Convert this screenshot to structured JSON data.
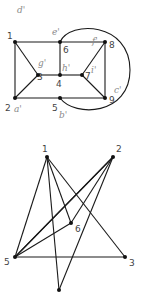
{
  "colors": {
    "edge": "#1a1a1a",
    "node": "#111111",
    "label": "#444444",
    "handwriting": "#8a8a8a"
  },
  "top_graph": {
    "nodes": [
      {
        "id": "1",
        "x": 15,
        "y": 42,
        "lx": 7,
        "ly": 39,
        "hand": "d'",
        "hx": 17,
        "hy": 13
      },
      {
        "id": "6",
        "x": 60,
        "y": 42,
        "lx": 63,
        "ly": 53,
        "hand": "e'",
        "hx": 52,
        "hy": 35
      },
      {
        "id": "8",
        "x": 105,
        "y": 42,
        "lx": 109,
        "ly": 48,
        "hand": "f'",
        "hx": 92,
        "hy": 44
      },
      {
        "id": "3",
        "x": 38,
        "y": 75,
        "lx": 37,
        "ly": 80,
        "hand": "g'",
        "hx": 38,
        "hy": 66
      },
      {
        "id": "4",
        "x": 60,
        "y": 75,
        "lx": 56,
        "ly": 87,
        "hand": "h'",
        "hx": 62,
        "hy": 71
      },
      {
        "id": "7",
        "x": 82,
        "y": 75,
        "lx": 85,
        "ly": 79,
        "hand": "i'",
        "hx": 91,
        "hy": 73
      },
      {
        "id": "2",
        "x": 15,
        "y": 98,
        "lx": 5,
        "ly": 111,
        "hand": "a'",
        "hx": 14,
        "hy": 112
      },
      {
        "id": "5",
        "x": 60,
        "y": 98,
        "lx": 52,
        "ly": 111,
        "hand": "b'",
        "hx": 59,
        "hy": 118
      },
      {
        "id": "9",
        "x": 105,
        "y": 98,
        "lx": 109,
        "ly": 103,
        "hand": "c'",
        "hx": 114,
        "hy": 93
      }
    ],
    "edges": [
      [
        "1",
        "6"
      ],
      [
        "6",
        "8"
      ],
      [
        "1",
        "2"
      ],
      [
        "1",
        "3"
      ],
      [
        "3",
        "4"
      ],
      [
        "4",
        "6"
      ],
      [
        "4",
        "7"
      ],
      [
        "7",
        "8"
      ],
      [
        "7",
        "9"
      ],
      [
        "8",
        "9"
      ],
      [
        "2",
        "3"
      ],
      [
        "2",
        "9"
      ]
    ],
    "arc": {
      "from": "6",
      "to": "5",
      "path": "M60,42 C70,20 130,22 130,70 C130,115 75,118 60,98"
    }
  },
  "bottom_graph": {
    "nodes": [
      {
        "id": "1",
        "x": 47,
        "y": 157,
        "label": "1",
        "lx": 42,
        "ly": 152
      },
      {
        "id": "2",
        "x": 113,
        "y": 157,
        "label": "2",
        "lx": 116,
        "ly": 152
      },
      {
        "id": "6",
        "x": 71,
        "y": 223,
        "label": "6",
        "lx": 75,
        "ly": 232
      },
      {
        "id": "5",
        "x": 15,
        "y": 257,
        "label": "5",
        "lx": 4,
        "ly": 265
      },
      {
        "id": "3",
        "x": 125,
        "y": 257,
        "label": "3",
        "lx": 129,
        "ly": 266
      },
      {
        "id": "b",
        "x": 59,
        "y": 290,
        "label": "",
        "lx": 0,
        "ly": 0
      }
    ],
    "edges": [
      [
        "1",
        "5"
      ],
      [
        "1",
        "3"
      ],
      [
        "1",
        "6"
      ],
      [
        "1",
        "b"
      ],
      [
        "2",
        "5"
      ],
      [
        "2",
        "6"
      ],
      [
        "2",
        "b"
      ],
      [
        "5",
        "6"
      ],
      [
        "5",
        "3"
      ]
    ],
    "extra_paths": [
      "M113,157 L15,257"
    ]
  }
}
